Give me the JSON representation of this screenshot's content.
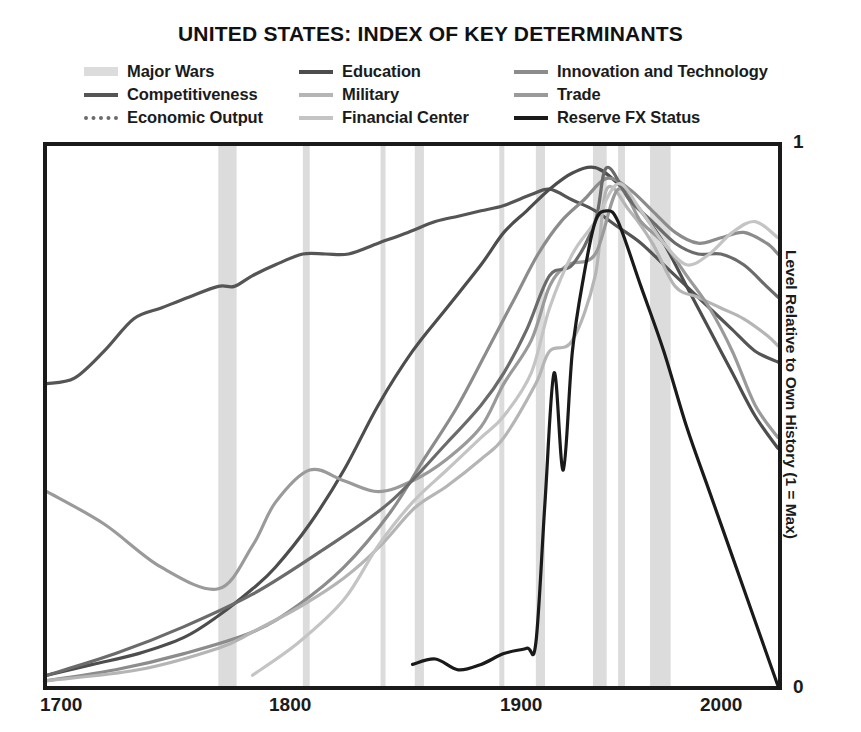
{
  "chart_data": {
    "type": "line",
    "title": "UNITED STATES: INDEX OF KEY DETERMINANTS",
    "xlabel": "",
    "ylabel": "Level Relative to Own History (1 = Max)",
    "xlim": [
      1700,
      2020
    ],
    "ylim": [
      0,
      1
    ],
    "grid": false,
    "legend_position": "top",
    "x_ticks": [
      "1700",
      "1800",
      "1900",
      "2000"
    ],
    "x_tick_values": [
      1700,
      1800,
      1900,
      2000
    ],
    "y_ticks": [
      "0",
      "1"
    ],
    "y_tick_values": [
      0,
      1
    ],
    "colors": {
      "major_wars_band": "#dcdcdc",
      "education": "#4d4d4d",
      "innovation_and_technology": "#8c8c8c",
      "competitiveness": "#555555",
      "military": "#b5b5b5",
      "trade": "#9a9a9a",
      "economic_output": "#6b6b6b",
      "financial_center": "#c4c4c4",
      "reserve_fx_status": "#1a1a1a"
    },
    "shaded_regions": {
      "name": "Major Wars",
      "color": "#dcdcdc",
      "spans": [
        [
          1775,
          1783
        ],
        [
          1812,
          1815
        ],
        [
          1846,
          1848
        ],
        [
          1861,
          1865
        ],
        [
          1898,
          1899
        ],
        [
          1914,
          1918
        ],
        [
          1939,
          1945
        ],
        [
          1950,
          1953
        ],
        [
          1964,
          1973
        ]
      ]
    },
    "series": [
      {
        "name": "Competitiveness",
        "color": "#555555",
        "x": [
          1700,
          1712,
          1725,
          1738,
          1750,
          1762,
          1775,
          1782,
          1790,
          1800,
          1812,
          1822,
          1832,
          1845,
          1858,
          1870,
          1880,
          1890,
          1900,
          1912,
          1920,
          1930,
          1940,
          1950,
          1960,
          1970,
          1980,
          1990,
          2000,
          2010,
          2020
        ],
        "values": [
          0.56,
          0.57,
          0.62,
          0.68,
          0.7,
          0.72,
          0.74,
          0.74,
          0.76,
          0.78,
          0.8,
          0.8,
          0.8,
          0.82,
          0.84,
          0.86,
          0.87,
          0.88,
          0.89,
          0.91,
          0.92,
          0.9,
          0.88,
          0.85,
          0.82,
          0.78,
          0.74,
          0.7,
          0.66,
          0.62,
          0.6
        ]
      },
      {
        "name": "Education",
        "color": "#4d4d4d",
        "x": [
          1700,
          1720,
          1740,
          1760,
          1775,
          1790,
          1800,
          1815,
          1830,
          1845,
          1860,
          1875,
          1890,
          1900,
          1910,
          1920,
          1930,
          1940,
          1950,
          1960,
          1970,
          1980,
          1990,
          2000,
          2010,
          2020
        ],
        "values": [
          0.02,
          0.04,
          0.06,
          0.09,
          0.13,
          0.18,
          0.22,
          0.3,
          0.4,
          0.52,
          0.62,
          0.7,
          0.78,
          0.84,
          0.88,
          0.92,
          0.95,
          0.96,
          0.93,
          0.88,
          0.82,
          0.74,
          0.66,
          0.58,
          0.5,
          0.44
        ]
      },
      {
        "name": "Innovation and Technology",
        "color": "#8c8c8c",
        "x": [
          1700,
          1730,
          1760,
          1790,
          1810,
          1830,
          1850,
          1865,
          1880,
          1895,
          1905,
          1915,
          1925,
          1935,
          1945,
          1955,
          1965,
          1975,
          1985,
          1995,
          2005,
          2015,
          2020
        ],
        "values": [
          0.01,
          0.03,
          0.06,
          0.1,
          0.15,
          0.22,
          0.32,
          0.42,
          0.52,
          0.64,
          0.72,
          0.8,
          0.86,
          0.9,
          0.94,
          0.92,
          0.88,
          0.84,
          0.82,
          0.83,
          0.84,
          0.82,
          0.8
        ]
      },
      {
        "name": "Military",
        "color": "#b5b5b5",
        "x": [
          1700,
          1740,
          1775,
          1790,
          1812,
          1830,
          1846,
          1861,
          1875,
          1890,
          1900,
          1914,
          1920,
          1930,
          1940,
          1945,
          1955,
          1965,
          1975,
          1985,
          1995,
          2005,
          2015,
          2020
        ],
        "values": [
          0.01,
          0.03,
          0.07,
          0.1,
          0.15,
          0.2,
          0.26,
          0.33,
          0.37,
          0.42,
          0.46,
          0.56,
          0.62,
          0.64,
          0.76,
          0.92,
          0.88,
          0.82,
          0.74,
          0.72,
          0.7,
          0.68,
          0.65,
          0.63
        ]
      },
      {
        "name": "Trade",
        "color": "#9a9a9a",
        "x": [
          1700,
          1725,
          1750,
          1775,
          1790,
          1800,
          1815,
          1830,
          1845,
          1860,
          1875,
          1890,
          1900,
          1912,
          1920,
          1928,
          1940,
          1950,
          1960,
          1970,
          1980,
          1990,
          2000,
          2010,
          2020
        ],
        "values": [
          0.36,
          0.3,
          0.22,
          0.18,
          0.26,
          0.34,
          0.4,
          0.38,
          0.36,
          0.38,
          0.42,
          0.48,
          0.56,
          0.64,
          0.74,
          0.78,
          0.8,
          0.92,
          0.86,
          0.82,
          0.76,
          0.7,
          0.62,
          0.52,
          0.46
        ]
      },
      {
        "name": "Economic Output",
        "color": "#6b6b6b",
        "x": [
          1700,
          1730,
          1760,
          1790,
          1820,
          1850,
          1875,
          1890,
          1900,
          1910,
          1920,
          1930,
          1940,
          1945,
          1955,
          1965,
          1975,
          1985,
          1995,
          2005,
          2015,
          2020
        ],
        "values": [
          0.02,
          0.06,
          0.11,
          0.17,
          0.25,
          0.34,
          0.45,
          0.52,
          0.58,
          0.66,
          0.76,
          0.78,
          0.86,
          0.96,
          0.9,
          0.86,
          0.82,
          0.8,
          0.8,
          0.78,
          0.74,
          0.72
        ]
      },
      {
        "name": "Financial Center",
        "color": "#c4c4c4",
        "x": [
          1790,
          1810,
          1830,
          1845,
          1860,
          1875,
          1890,
          1900,
          1912,
          1920,
          1930,
          1940,
          1950,
          1960,
          1970,
          1980,
          1990,
          2000,
          2010,
          2020
        ],
        "values": [
          0.02,
          0.08,
          0.16,
          0.26,
          0.34,
          0.4,
          0.46,
          0.5,
          0.58,
          0.7,
          0.8,
          0.86,
          0.93,
          0.88,
          0.82,
          0.78,
          0.8,
          0.84,
          0.86,
          0.83
        ]
      },
      {
        "name": "Reserve FX Status",
        "color": "#1a1a1a",
        "x": [
          1860,
          1870,
          1880,
          1890,
          1900,
          1910,
          1914,
          1918,
          1922,
          1926,
          1930,
          1935,
          1940,
          1945,
          1950,
          1960,
          1970,
          1980,
          1990,
          2000,
          2010,
          2020
        ],
        "values": [
          0.04,
          0.05,
          0.03,
          0.04,
          0.06,
          0.07,
          0.08,
          0.34,
          0.58,
          0.4,
          0.62,
          0.76,
          0.86,
          0.88,
          0.86,
          0.74,
          0.62,
          0.48,
          0.36,
          0.24,
          0.12,
          0.0
        ]
      }
    ]
  },
  "legend": {
    "items": [
      {
        "label": "Major Wars",
        "style": "band",
        "color": "#dcdcdc"
      },
      {
        "label": "Education",
        "style": "solid",
        "color": "#4d4d4d"
      },
      {
        "label": "Innovation and Technology",
        "style": "solid",
        "color": "#8c8c8c"
      },
      {
        "label": "Competitiveness",
        "style": "solid",
        "color": "#555555"
      },
      {
        "label": "Military",
        "style": "solid",
        "color": "#b5b5b5"
      },
      {
        "label": "Trade",
        "style": "solid",
        "color": "#9a9a9a"
      },
      {
        "label": "Economic Output",
        "style": "dotted",
        "color": "#6b6b6b"
      },
      {
        "label": "Financial Center",
        "style": "solid",
        "color": "#c4c4c4"
      },
      {
        "label": "Reserve FX Status",
        "style": "solid",
        "color": "#1a1a1a"
      }
    ]
  },
  "axis": {
    "x_ticks": [
      "1700",
      "1800",
      "1900",
      "2000"
    ],
    "y_top": "1",
    "y_bottom": "0",
    "y_title": "Level Relative to Own History (1 = Max)"
  }
}
